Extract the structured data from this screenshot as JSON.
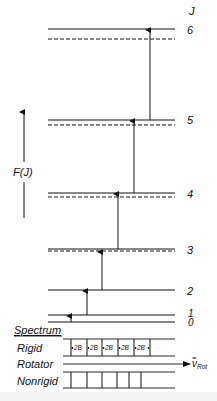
{
  "diagram": {
    "type": "rotational-energy-level-diagram",
    "axis_label": "F(J)",
    "quantum_number_header": "J",
    "levels": [
      {
        "J": "0",
        "label": "0",
        "y_solid": 322,
        "y_dashed": 322
      },
      {
        "J": "1",
        "label": "1",
        "y_solid": 315,
        "y_dashed": 315
      },
      {
        "J": "2",
        "label": "2",
        "y_solid": 290,
        "y_dashed": 290
      },
      {
        "J": "3",
        "label": "3",
        "y_solid": 249,
        "y_dashed": 251
      },
      {
        "J": "4",
        "label": "4",
        "y_solid": 193,
        "y_dashed": 197
      },
      {
        "J": "5",
        "label": "5",
        "y_solid": 120,
        "y_dashed": 125
      },
      {
        "J": "6",
        "label": "6",
        "y_solid": 29,
        "y_dashed": 39
      }
    ],
    "transitions": [
      {
        "from": "0",
        "to": "1",
        "x": 71
      },
      {
        "from": "1",
        "to": "2",
        "x": 87
      },
      {
        "from": "2",
        "to": "3",
        "x": 102
      },
      {
        "from": "3",
        "to": "4",
        "x": 118
      },
      {
        "from": "4",
        "to": "5",
        "x": 134
      },
      {
        "from": "5",
        "to": "6",
        "x": 150
      }
    ],
    "legend": {
      "solid_line": "rigid rotator levels",
      "dashed_line": "nonrigid rotator levels"
    }
  },
  "spectrum": {
    "title": "Spectrum",
    "rows": [
      {
        "label": "Rigid",
        "lines_x": [
          71,
          87,
          102,
          118,
          134,
          150
        ],
        "spacing_labels": [
          "2B",
          "2B",
          "2B",
          "2B",
          "2B"
        ]
      },
      {
        "label": "Rotator",
        "axis_label_main": "ν̃",
        "axis_label_sub": "Rot"
      },
      {
        "label": "Nonrigid",
        "lines_x": [
          71,
          87,
          102,
          117,
          129,
          141
        ]
      }
    ]
  }
}
